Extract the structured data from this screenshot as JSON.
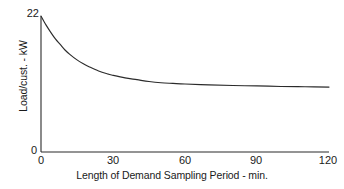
{
  "chart_data": {
    "type": "line",
    "title": "",
    "xlabel": "Length of Demand Sampling Period - min.",
    "ylabel": "Load/cust. - kW",
    "xlim": [
      0,
      120
    ],
    "ylim": [
      0,
      22
    ],
    "xticks": [
      0,
      30,
      60,
      90,
      120
    ],
    "xticklabels": [
      "0",
      "30",
      "60",
      "90",
      "120"
    ],
    "yticks": [
      0,
      22
    ],
    "yticklabels": [
      "0",
      "22"
    ],
    "grid": false,
    "legend": false,
    "series": [
      {
        "name": "Load per customer",
        "x": [
          0,
          2,
          4,
          6,
          8,
          10,
          12,
          15,
          18,
          20,
          24,
          28,
          30,
          35,
          40,
          45,
          50,
          55,
          60,
          70,
          80,
          90,
          100,
          110,
          120
        ],
        "values": [
          22.0,
          20.6,
          19.4,
          18.3,
          17.4,
          16.5,
          15.8,
          14.9,
          14.2,
          13.8,
          13.1,
          12.6,
          12.4,
          12.0,
          11.7,
          11.4,
          11.2,
          11.1,
          11.0,
          10.85,
          10.75,
          10.7,
          10.6,
          10.55,
          10.5
        ]
      }
    ],
    "annotations": {
      "curve_shape": "monotonic exponential decay to asymptote",
      "start_value": 22,
      "asymptote_value": 10.5
    },
    "colors": {
      "curve": "#2b2b2b",
      "axis": "#2b2b2b",
      "background": "#ffffff"
    }
  }
}
